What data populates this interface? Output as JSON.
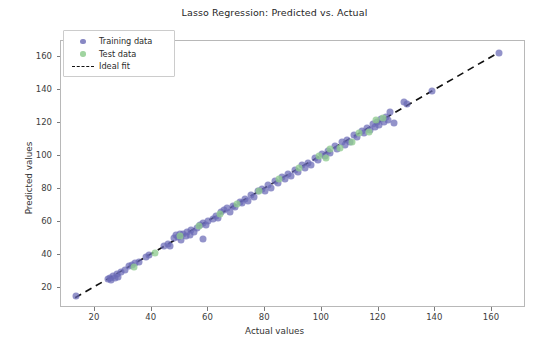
{
  "chart_data": {
    "type": "scatter",
    "title": "Lasso Regression: Predicted vs. Actual",
    "xlabel": "Actual values",
    "ylabel": "Predicted values",
    "xlim": [
      8,
      172
    ],
    "ylim": [
      8,
      170
    ],
    "xticks": [
      20,
      40,
      60,
      80,
      100,
      120,
      140,
      160
    ],
    "yticks": [
      20,
      40,
      60,
      80,
      100,
      120,
      140,
      160
    ],
    "grid": false,
    "legend_position": "upper left",
    "legend": [
      {
        "label": "Training data",
        "marker": "circle",
        "color": "#6a6ab5"
      },
      {
        "label": "Test data",
        "marker": "circle",
        "color": "#8fcc8f"
      },
      {
        "label": "Ideal fit",
        "marker": "dashed-line",
        "color": "#111111"
      }
    ],
    "reference_line": {
      "name": "Ideal fit",
      "style": "dashed",
      "color": "#111111",
      "x": [
        13,
        163
      ],
      "y": [
        13,
        163
      ]
    },
    "series": [
      {
        "name": "Training data",
        "color": "#6a6ab5",
        "points": [
          [
            13.2,
            15.0
          ],
          [
            24.5,
            25.5
          ],
          [
            25.2,
            26.4
          ],
          [
            25.8,
            24.9
          ],
          [
            26.4,
            27.2
          ],
          [
            27.0,
            26.0
          ],
          [
            27.6,
            28.4
          ],
          [
            28.2,
            27.1
          ],
          [
            29.0,
            29.6
          ],
          [
            30.5,
            31.0
          ],
          [
            32.0,
            33.4
          ],
          [
            33.2,
            34.0
          ],
          [
            34.0,
            35.2
          ],
          [
            35.5,
            36.0
          ],
          [
            38.0,
            39.0
          ],
          [
            39.2,
            40.3
          ],
          [
            44.5,
            45.6
          ],
          [
            45.8,
            47.0
          ],
          [
            46.5,
            45.8
          ],
          [
            48.0,
            50.5
          ],
          [
            48.6,
            52.0
          ],
          [
            49.2,
            51.0
          ],
          [
            49.8,
            53.2
          ],
          [
            50.4,
            49.5
          ],
          [
            51.2,
            52.8
          ],
          [
            52.0,
            51.4
          ],
          [
            52.6,
            54.0
          ],
          [
            53.4,
            52.2
          ],
          [
            54.0,
            55.3
          ],
          [
            55.0,
            54.0
          ],
          [
            55.8,
            56.6
          ],
          [
            58.2,
            49.8
          ],
          [
            57.0,
            58.2
          ],
          [
            58.0,
            59.4
          ],
          [
            59.0,
            58.5
          ],
          [
            60.0,
            61.0
          ],
          [
            61.5,
            62.2
          ],
          [
            62.5,
            63.6
          ],
          [
            63.5,
            62.8
          ],
          [
            64.5,
            66.0
          ],
          [
            65.5,
            67.2
          ],
          [
            66.5,
            68.4
          ],
          [
            67.5,
            66.5
          ],
          [
            68.5,
            70.0
          ],
          [
            69.5,
            69.0
          ],
          [
            71.0,
            72.6
          ],
          [
            72.0,
            71.5
          ],
          [
            73.0,
            74.0
          ],
          [
            74.0,
            73.2
          ],
          [
            75.0,
            76.5
          ],
          [
            76.0,
            75.4
          ],
          [
            77.5,
            78.8
          ],
          [
            79.0,
            80.2
          ],
          [
            80.0,
            79.0
          ],
          [
            81.0,
            82.4
          ],
          [
            82.0,
            81.0
          ],
          [
            83.5,
            85.0
          ],
          [
            84.5,
            83.6
          ],
          [
            86.0,
            87.2
          ],
          [
            87.0,
            86.0
          ],
          [
            88.0,
            89.4
          ],
          [
            89.0,
            88.2
          ],
          [
            90.5,
            92.0
          ],
          [
            91.5,
            90.6
          ],
          [
            93.0,
            94.5
          ],
          [
            94.0,
            93.2
          ],
          [
            95.0,
            96.0
          ],
          [
            96.0,
            94.8
          ],
          [
            97.5,
            99.0
          ],
          [
            98.5,
            97.6
          ],
          [
            100.0,
            101.5
          ],
          [
            101.0,
            100.2
          ],
          [
            102.0,
            103.0
          ],
          [
            103.0,
            101.8
          ],
          [
            104.5,
            106.0
          ],
          [
            105.5,
            104.6
          ],
          [
            107.0,
            108.5
          ],
          [
            108.0,
            107.2
          ],
          [
            109.0,
            110.0
          ],
          [
            110.0,
            108.8
          ],
          [
            111.5,
            113.0
          ],
          [
            112.5,
            111.6
          ],
          [
            114.0,
            115.5
          ],
          [
            115.0,
            114.2
          ],
          [
            116.0,
            117.0
          ],
          [
            117.0,
            115.8
          ],
          [
            118.0,
            119.5
          ],
          [
            118.8,
            118.0
          ],
          [
            119.5,
            120.8
          ],
          [
            120.2,
            119.2
          ],
          [
            121.0,
            122.5
          ],
          [
            121.8,
            121.0
          ],
          [
            122.5,
            123.8
          ],
          [
            123.2,
            122.2
          ],
          [
            124.0,
            127.0
          ],
          [
            125.5,
            120.5
          ],
          [
            129.0,
            132.8
          ],
          [
            130.0,
            131.5
          ],
          [
            139.0,
            139.5
          ],
          [
            162.5,
            162.8
          ]
        ]
      },
      {
        "name": "Test data",
        "color": "#8fcc8f",
        "points": [
          [
            33.8,
            33.0
          ],
          [
            41.0,
            41.5
          ],
          [
            50.0,
            51.5
          ],
          [
            56.5,
            57.5
          ],
          [
            64.0,
            65.0
          ],
          [
            70.0,
            71.0
          ],
          [
            78.0,
            79.0
          ],
          [
            85.0,
            86.0
          ],
          [
            92.0,
            93.0
          ],
          [
            99.0,
            100.0
          ],
          [
            101.5,
            99.0
          ],
          [
            103.0,
            104.5
          ],
          [
            106.5,
            105.0
          ],
          [
            110.5,
            109.0
          ],
          [
            113.0,
            114.0
          ],
          [
            116.5,
            115.0
          ],
          [
            119.0,
            122.0
          ],
          [
            121.5,
            123.0
          ]
        ]
      }
    ]
  }
}
